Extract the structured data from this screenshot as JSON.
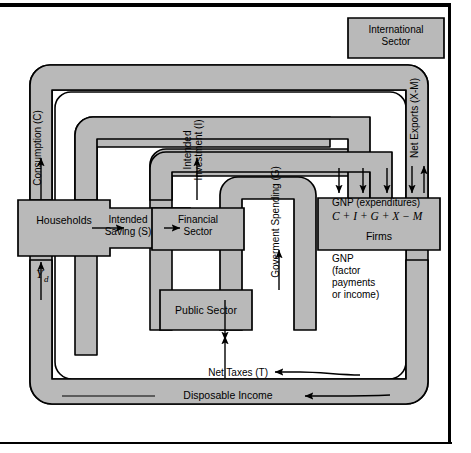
{
  "figure": {
    "fill_color": "#b9b9b9",
    "stroke_color": "#000000",
    "background_color": "#ffffff"
  },
  "sectors": {
    "households": "Households",
    "firms": "Firms",
    "financial_sector_line1": "Financial",
    "financial_sector_line2": "Sector",
    "public_sector": "Public Sector",
    "international_sector_line1": "International",
    "international_sector_line2": "Sector"
  },
  "flows": {
    "consumption": "Consumption (C)",
    "intended_investment_line1": "Intended",
    "intended_investment_line2": "Investment (I)",
    "government_spending": "Goverment Spending (G)",
    "net_exports": "Net Exports (X-M)",
    "intended_saving_line1": "Intended",
    "intended_saving_line2": "Saving (S)",
    "net_taxes": "Net Taxes (T)",
    "disposable_income": "Disposable Income",
    "disposable_income_symbol": "Y",
    "disposable_income_subscript": "d"
  },
  "firms_labels": {
    "gnp_expenditures": "GNP (expenditures)",
    "gnp_equation": "C + I + G + X − M",
    "gnp_factor_line1": "GNP",
    "gnp_factor_line2": "(factor",
    "gnp_factor_line3": "payments",
    "gnp_factor_line4": "or income)"
  }
}
